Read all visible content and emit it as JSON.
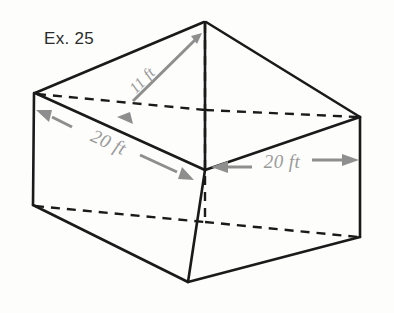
{
  "figure": {
    "caption": "Ex. 25",
    "background_color": "#fdfdfc",
    "edge_color": "#1a1a1a",
    "dimension_color": "#8e8e8e",
    "label_color": "#9a9a9a",
    "labels": {
      "slant": "11 ft",
      "base_left": "20 ft",
      "base_right": "20 ft"
    },
    "dimensions": [
      {
        "name": "pyramid-slant-edge",
        "value": "11 ft",
        "unit": "ft",
        "magnitude": 11
      },
      {
        "name": "base-edge-left",
        "value": "20 ft",
        "unit": "ft",
        "magnitude": 20
      },
      {
        "name": "base-edge-right",
        "value": "20 ft",
        "unit": "ft",
        "magnitude": 20
      }
    ],
    "vertices": {
      "apex": [
        205,
        22
      ],
      "top_left": [
        35,
        93
      ],
      "top_back": [
        205,
        110
      ],
      "top_right": [
        360,
        117
      ],
      "top_front": [
        205,
        170
      ],
      "bottom_left": [
        33,
        205
      ],
      "bottom_back": [
        205,
        222
      ],
      "bottom_right": [
        360,
        237
      ],
      "bottom_front": [
        188,
        282
      ]
    }
  }
}
